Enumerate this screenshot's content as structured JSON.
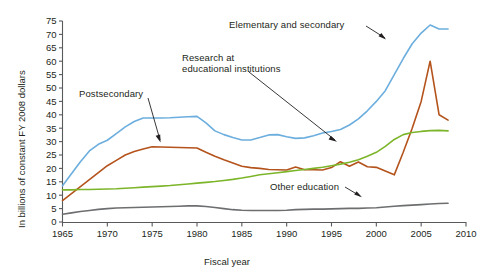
{
  "chart_data": {
    "type": "line",
    "title": "",
    "subtitle": "",
    "xlabel": "Fiscal year",
    "ylabel": "In billions of constant FY 2008 dollars",
    "xlim": [
      1965,
      2010
    ],
    "ylim": [
      0,
      75
    ],
    "xticks": [
      1965,
      1970,
      1975,
      1980,
      1985,
      1990,
      1995,
      2000,
      2005,
      2010
    ],
    "yticks": [
      0,
      5,
      10,
      15,
      20,
      25,
      30,
      35,
      40,
      45,
      50,
      55,
      60,
      65,
      70,
      75
    ],
    "grid": false,
    "legend": "none",
    "annotations": [
      {
        "id": "elementary-and-secondary",
        "text": "Elementary and secondary",
        "x": 262,
        "y": 23,
        "arrow": true
      },
      {
        "id": "research-at-educational-institutions",
        "text": "Research at\neducational institutions",
        "line1": "Research at",
        "line2": "educational institutions",
        "x": 184,
        "y": 57,
        "arrow": true
      },
      {
        "id": "postsecondary",
        "text": "Postsecondary",
        "x": 78,
        "y": 89,
        "arrow": true
      },
      {
        "id": "other-education",
        "text": "Other education",
        "x": 272,
        "y": 184,
        "arrow": true
      }
    ],
    "series": [
      {
        "name": "Elementary and secondary",
        "color": "#6caedd",
        "x": [
          1965,
          1966,
          1967,
          1968,
          1969,
          1970,
          1971,
          1972,
          1973,
          1974,
          1975,
          1976,
          1977,
          1978,
          1979,
          1980,
          1981,
          1982,
          1983,
          1984,
          1985,
          1986,
          1987,
          1988,
          1989,
          1990,
          1991,
          1992,
          1993,
          1994,
          1995,
          1996,
          1997,
          1998,
          1999,
          2000,
          2001,
          2002,
          2003,
          2004,
          2005,
          2006,
          2007,
          2008
        ],
        "values": [
          13.5,
          18.0,
          22.5,
          26.5,
          29.0,
          30.5,
          33.0,
          35.5,
          37.5,
          38.8,
          38.8,
          38.8,
          38.9,
          39.1,
          39.3,
          39.4,
          37.0,
          34.0,
          32.6,
          31.5,
          30.6,
          30.6,
          31.5,
          32.5,
          32.6,
          31.8,
          31.2,
          31.4,
          32.2,
          33.2,
          33.8,
          34.5,
          36.2,
          38.5,
          41.5,
          45.0,
          49.0,
          55.0,
          61.0,
          66.5,
          70.5,
          73.5,
          72.0,
          72.0
        ]
      },
      {
        "name": "Postsecondary",
        "color": "#b4531c",
        "x": [
          1965,
          1966,
          1967,
          1968,
          1969,
          1970,
          1971,
          1972,
          1973,
          1974,
          1975,
          1976,
          1977,
          1978,
          1979,
          1980,
          1981,
          1982,
          1983,
          1984,
          1985,
          1986,
          1987,
          1988,
          1989,
          1990,
          1991,
          1992,
          1993,
          1994,
          1995,
          1996,
          1997,
          1998,
          1999,
          2000,
          2001,
          2002,
          2003,
          2004,
          2005,
          2006,
          2007,
          2008
        ],
        "values": [
          8.0,
          10.6,
          13.2,
          15.8,
          18.4,
          21.0,
          23.0,
          25.0,
          26.3,
          27.2,
          28.1,
          28.0,
          27.9,
          27.8,
          27.7,
          27.6,
          26.0,
          24.5,
          23.2,
          22.0,
          20.8,
          20.3,
          20.0,
          19.6,
          19.5,
          19.4,
          20.5,
          19.5,
          19.5,
          19.4,
          20.3,
          22.5,
          20.8,
          22.4,
          20.6,
          20.4,
          19.0,
          17.6,
          26.0,
          35.0,
          45.0,
          60.0,
          40.0,
          38.0
        ]
      },
      {
        "name": "Research at educational institutions",
        "color": "#7db52a",
        "x": [
          1965,
          1966,
          1967,
          1968,
          1969,
          1970,
          1971,
          1972,
          1973,
          1974,
          1975,
          1976,
          1977,
          1978,
          1979,
          1980,
          1981,
          1982,
          1983,
          1984,
          1985,
          1986,
          1987,
          1988,
          1989,
          1990,
          1991,
          1992,
          1993,
          1994,
          1995,
          1996,
          1997,
          1998,
          1999,
          2000,
          2001,
          2002,
          2003,
          2004,
          2005,
          2006,
          2007,
          2008
        ],
        "values": [
          12.0,
          12.0,
          12.1,
          12.1,
          12.2,
          12.3,
          12.4,
          12.6,
          12.8,
          13.0,
          13.2,
          13.4,
          13.6,
          13.9,
          14.2,
          14.5,
          14.8,
          15.1,
          15.5,
          15.9,
          16.4,
          17.0,
          17.6,
          18.0,
          18.4,
          18.8,
          19.2,
          19.6,
          20.0,
          20.4,
          21.0,
          21.6,
          22.3,
          23.2,
          24.5,
          26.0,
          28.2,
          30.8,
          32.6,
          33.4,
          33.8,
          34.1,
          34.2,
          34.0
        ]
      },
      {
        "name": "Other education",
        "color": "#6d6e70",
        "x": [
          1965,
          1966,
          1967,
          1968,
          1969,
          1970,
          1971,
          1972,
          1973,
          1974,
          1975,
          1976,
          1977,
          1978,
          1979,
          1980,
          1981,
          1982,
          1983,
          1984,
          1985,
          1986,
          1987,
          1988,
          1989,
          1990,
          1991,
          1992,
          1993,
          1994,
          1995,
          1996,
          1997,
          1998,
          1999,
          2000,
          2001,
          2002,
          2003,
          2004,
          2005,
          2006,
          2007,
          2008
        ],
        "values": [
          2.9,
          3.4,
          3.9,
          4.3,
          4.7,
          5.0,
          5.2,
          5.3,
          5.4,
          5.5,
          5.6,
          5.7,
          5.8,
          5.9,
          6.0,
          6.0,
          5.8,
          5.4,
          5.0,
          4.6,
          4.4,
          4.3,
          4.3,
          4.3,
          4.3,
          4.4,
          4.6,
          4.7,
          4.8,
          4.8,
          4.9,
          5.0,
          5.1,
          5.1,
          5.2,
          5.3,
          5.6,
          5.9,
          6.1,
          6.3,
          6.5,
          6.7,
          6.9,
          7.0
        ]
      }
    ]
  },
  "axis": {
    "y_tick_labels": [
      "0",
      "5",
      "10",
      "15",
      "20",
      "25",
      "30",
      "35",
      "40",
      "45",
      "50",
      "55",
      "60",
      "65",
      "70",
      "75"
    ],
    "x_tick_labels": [
      "1965",
      "1970",
      "1975",
      "1980",
      "1985",
      "1990",
      "1995",
      "2000",
      "2005",
      "2010"
    ],
    "x_title": "Fiscal year",
    "y_title": "In billions of constant FY 2008 dollars"
  },
  "annotations": {
    "elementary": "Elementary and secondary",
    "research_line1": "Research at",
    "research_line2": "educational institutions",
    "postsecondary": "Postsecondary",
    "other": "Other education"
  },
  "colors": {
    "elementary": "#6caedd",
    "postsecondary": "#b4531c",
    "research": "#7db52a",
    "other": "#6d6e70",
    "axis": "#58595b",
    "text": "#231f20"
  }
}
